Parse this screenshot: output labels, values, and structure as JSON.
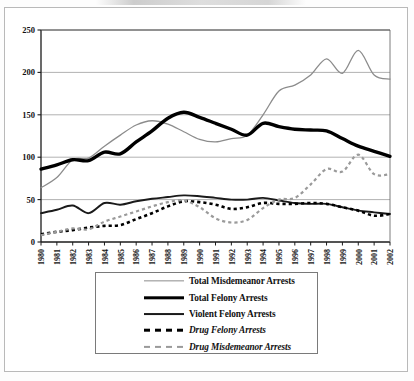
{
  "chart_data": {
    "type": "line",
    "title": "",
    "xlabel": "",
    "ylabel": "",
    "ylim": [
      0,
      250
    ],
    "yticks": [
      0,
      50,
      100,
      150,
      200,
      250
    ],
    "grid": true,
    "legend_position": "bottom",
    "x": [
      1980,
      1981,
      1982,
      1983,
      1984,
      1985,
      1986,
      1987,
      1988,
      1989,
      1990,
      1991,
      1992,
      1993,
      1994,
      1995,
      1996,
      1997,
      1998,
      1999,
      2000,
      2001,
      2002
    ],
    "categories": [
      "1980",
      "1981",
      "1982",
      "1983",
      "1984",
      "1985",
      "1986",
      "1987",
      "1988",
      "1989",
      "1990",
      "1991",
      "1992",
      "1993",
      "1994",
      "1995",
      "1996",
      "1997",
      "1998",
      "1999",
      "2000",
      "2001",
      "2002"
    ],
    "series": [
      {
        "name": "Total Misdemeanor Arrests",
        "color": "#8c8c8c",
        "style": "solid-thin",
        "values": [
          64,
          76,
          97,
          99,
          113,
          126,
          138,
          143,
          139,
          130,
          121,
          118,
          122,
          126,
          150,
          178,
          185,
          197,
          216,
          199,
          226,
          197,
          192
        ]
      },
      {
        "name": "Total Felony Arrests",
        "color": "#000000",
        "style": "solid-thick",
        "values": [
          86,
          91,
          97,
          96,
          106,
          104,
          118,
          131,
          146,
          153,
          147,
          140,
          133,
          126,
          140,
          136,
          133,
          132,
          131,
          122,
          113,
          107,
          101
        ]
      },
      {
        "name": "Violent Felony Arrests",
        "color": "#1a1a1a",
        "style": "solid-medium",
        "values": [
          34,
          38,
          43,
          34,
          46,
          44,
          48,
          51,
          53,
          55,
          54,
          52,
          50,
          50,
          52,
          49,
          46,
          45,
          45,
          41,
          37,
          35,
          33
        ]
      },
      {
        "name": "Drug Felony Arrests",
        "color": "#000000",
        "style": "dashed",
        "values": [
          9,
          12,
          14,
          17,
          19,
          20,
          27,
          34,
          42,
          48,
          47,
          44,
          39,
          41,
          46,
          45,
          45,
          46,
          45,
          41,
          37,
          31,
          33
        ]
      },
      {
        "name": "Drug Misdemeanor Arrests",
        "color": "#9a9a9a",
        "style": "dashed",
        "values": [
          8,
          12,
          16,
          15,
          24,
          30,
          36,
          42,
          47,
          49,
          41,
          28,
          23,
          26,
          40,
          50,
          52,
          68,
          86,
          83,
          103,
          80,
          80
        ]
      }
    ]
  },
  "axis": {
    "y_labels": [
      "250",
      "200",
      "150",
      "100",
      "50",
      "0"
    ],
    "x_labels": [
      "1980",
      "1981",
      "1982",
      "1983",
      "1984",
      "1985",
      "1986",
      "1987",
      "1988",
      "1989",
      "1990",
      "1991",
      "1992",
      "1993",
      "1994",
      "1995",
      "1996",
      "1997",
      "1998",
      "1999",
      "2000",
      "2001",
      "2002"
    ]
  },
  "legend": {
    "items": [
      {
        "label": "Total Misdemeanor Arrests",
        "swatch": "sw-misd",
        "italic": false
      },
      {
        "label": "Total Felony Arrests",
        "swatch": "sw-felony",
        "italic": false
      },
      {
        "label": "Violent Felony Arrests",
        "swatch": "sw-violent",
        "italic": false
      },
      {
        "label": "Drug Felony Arrests",
        "swatch": "sw-drugf",
        "italic": true
      },
      {
        "label": "Drug Misdemeanor Arrests",
        "swatch": "sw-drugm",
        "italic": true
      }
    ]
  }
}
